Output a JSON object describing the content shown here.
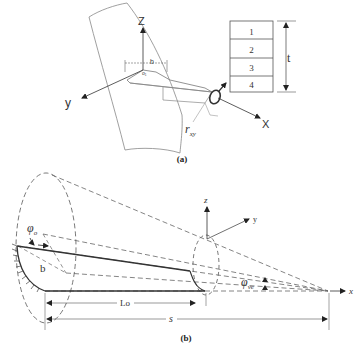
{
  "figure": {
    "panel_a": {
      "caption": "(a)",
      "axes": {
        "z": "Z",
        "y": "y",
        "x": "X"
      },
      "width_label": "b",
      "origin_label": "o₁",
      "radius_label": "r",
      "radius_subscript": "xy",
      "layers": [
        "1",
        "2",
        "3",
        "4"
      ],
      "thickness_label": "t"
    },
    "panel_b": {
      "caption": "(b)",
      "axes": {
        "z": "z",
        "y": "y",
        "x": "x"
      },
      "phi_o_label": "φ",
      "phi_o_subscript": "o",
      "phi_ve_label": "φ",
      "phi_ve_subscript": "ve",
      "b_label": "b",
      "lo_label": "Lo",
      "s_label": "s"
    }
  }
}
